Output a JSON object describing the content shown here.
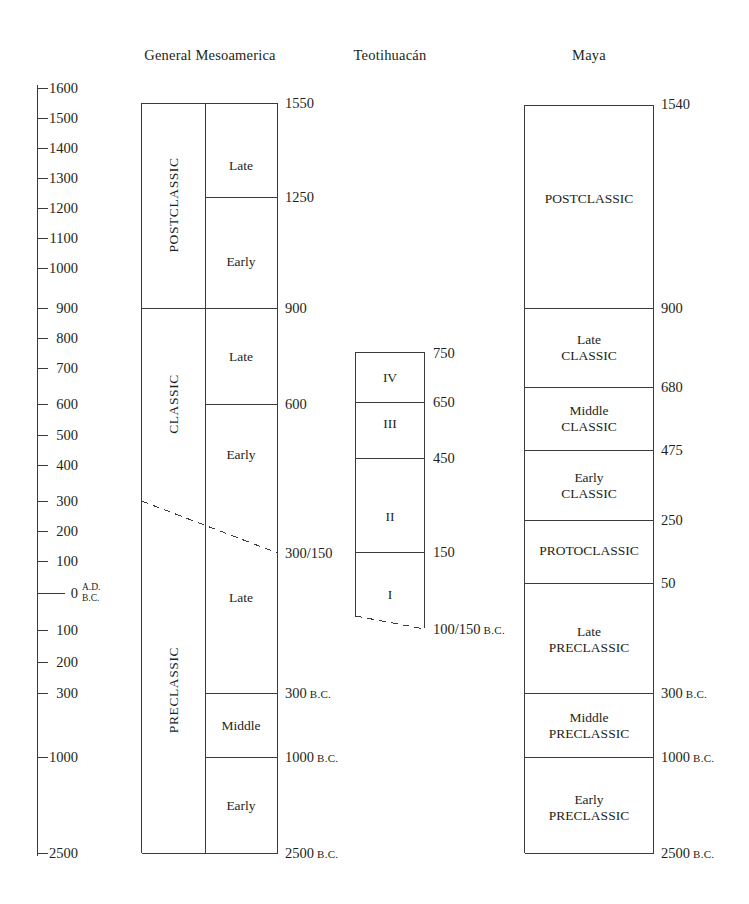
{
  "figure": {
    "type": "chronology-chart",
    "background_color": "#ffffff",
    "line_color": "#3b3b3b",
    "text_color": "#231f20"
  },
  "columns": [
    {
      "key": "general_mesoamerica",
      "header": "General Mesoamerica"
    },
    {
      "key": "teotihuacan",
      "header": "Teotihuacán"
    },
    {
      "key": "maya",
      "header": "Maya"
    }
  ],
  "axis": {
    "name": "time-axis",
    "era_upper": "A.D.",
    "era_lower": "B.C.",
    "zero_label": "0",
    "ticks": [
      {
        "label": "1600",
        "y": 88
      },
      {
        "label": "1500",
        "y": 118
      },
      {
        "label": "1400",
        "y": 148
      },
      {
        "label": "1300",
        "y": 178
      },
      {
        "label": "1200",
        "y": 208
      },
      {
        "label": "1100",
        "y": 238
      },
      {
        "label": "1000",
        "y": 268
      },
      {
        "label": "900",
        "y": 308
      },
      {
        "label": "800",
        "y": 338
      },
      {
        "label": "700",
        "y": 368
      },
      {
        "label": "600",
        "y": 404
      },
      {
        "label": "500",
        "y": 435
      },
      {
        "label": "400",
        "y": 465
      },
      {
        "label": "300",
        "y": 501
      },
      {
        "label": "200",
        "y": 531
      },
      {
        "label": "100",
        "y": 561
      },
      {
        "label": "0",
        "y": 593
      },
      {
        "label": "100",
        "y": 630
      },
      {
        "label": "200",
        "y": 662
      },
      {
        "label": "300",
        "y": 693
      },
      {
        "label": "1000",
        "y": 757
      },
      {
        "label": "2500",
        "y": 853
      }
    ]
  },
  "chart_data": {
    "type": "table",
    "ylabel": "Years (A.D. above, B.C. below)",
    "axis_tick_labels": [
      "1600",
      "1500",
      "1400",
      "1300",
      "1200",
      "1100",
      "1000",
      "900",
      "800",
      "700",
      "600",
      "500",
      "400",
      "300",
      "200",
      "100",
      "0",
      "100",
      "200",
      "300",
      "1000",
      "2500"
    ],
    "series": [
      {
        "name": "General Mesoamerica",
        "major_periods": [
          {
            "label": "POSTCLASSIC",
            "from": "A.D. 1550",
            "to": "A.D. 900"
          },
          {
            "label": "CLASSIC",
            "from": "A.D. 900",
            "to": "A.D. 300/150"
          },
          {
            "label": "PRECLASSIC",
            "from": "A.D. 300/150",
            "to": "2500 B.C."
          }
        ],
        "sub_periods": [
          {
            "label": "Late",
            "from": "A.D. 1550",
            "to": "A.D. 1250"
          },
          {
            "label": "Early",
            "from": "A.D. 1250",
            "to": "A.D. 900"
          },
          {
            "label": "Late",
            "from": "A.D. 900",
            "to": "A.D. 600"
          },
          {
            "label": "Early",
            "from": "A.D. 600",
            "to": "A.D. 300/150"
          },
          {
            "label": "Late",
            "from": "A.D. 300/150",
            "to": "300 B.C."
          },
          {
            "label": "Middle",
            "from": "300 B.C.",
            "to": "1000 B.C."
          },
          {
            "label": "Early",
            "from": "1000 B.C.",
            "to": "2500 B.C."
          }
        ],
        "boundary_labels": [
          "1550",
          "1250",
          "900",
          "600",
          "300/150",
          "300 B.C.",
          "1000 B.C.",
          "2500 B.C."
        ]
      },
      {
        "name": "Teotihuacán",
        "phases": [
          {
            "label": "IV",
            "from": "A.D. 750",
            "to": "A.D. 650"
          },
          {
            "label": "III",
            "from": "A.D. 650",
            "to": "A.D. 450"
          },
          {
            "label": "II",
            "from": "A.D. 450",
            "to": "A.D. 150"
          },
          {
            "label": "I",
            "from": "A.D. 150",
            "to": "100/150 B.C."
          }
        ],
        "boundary_labels": [
          "750",
          "650",
          "450",
          "150",
          "100/150 B.C."
        ]
      },
      {
        "name": "Maya",
        "periods": [
          {
            "label": "POSTCLASSIC",
            "from": "A.D. 1540",
            "to": "A.D. 900"
          },
          {
            "label": "Late CLASSIC",
            "from": "A.D. 900",
            "to": "A.D. 680"
          },
          {
            "label": "Middle CLASSIC",
            "from": "A.D. 680",
            "to": "A.D. 475"
          },
          {
            "label": "Early CLASSIC",
            "from": "A.D. 475",
            "to": "A.D. 250"
          },
          {
            "label": "PROTOCLASSIC",
            "from": "A.D. 250",
            "to": "A.D. 50"
          },
          {
            "label": "Late PRECLASSIC",
            "from": "A.D. 50",
            "to": "300 B.C."
          },
          {
            "label": "Middle PRECLASSIC",
            "from": "300 B.C.",
            "to": "1000 B.C."
          },
          {
            "label": "Early PRECLASSIC",
            "from": "1000 B.C.",
            "to": "2500 B.C."
          }
        ],
        "boundary_labels": [
          "1540",
          "900",
          "680",
          "475",
          "250",
          "50",
          "300 B.C.",
          "1000 B.C.",
          "2500 B.C."
        ]
      }
    ]
  },
  "general_mesoamerica": {
    "header": "General Mesoamerica",
    "major": [
      {
        "label": "POSTCLASSIC",
        "y": 205
      },
      {
        "label": "CLASSIC",
        "y": 404
      },
      {
        "label": "PRECLASSIC",
        "y": 690
      }
    ],
    "sub": [
      {
        "label": "Late",
        "y": 166
      },
      {
        "label": "Early",
        "y": 262
      },
      {
        "label": "Late",
        "y": 357
      },
      {
        "label": "Early",
        "y": 455
      },
      {
        "label": "Late",
        "y": 598
      },
      {
        "label": "Middle",
        "y": 726
      },
      {
        "label": "Early",
        "y": 806
      }
    ],
    "dates": [
      {
        "label": "1550",
        "suffix": "",
        "y": 103
      },
      {
        "label": "1250",
        "suffix": "",
        "y": 197
      },
      {
        "label": "900",
        "suffix": "",
        "y": 308
      },
      {
        "label": "600",
        "suffix": "",
        "y": 404
      },
      {
        "label": "300/150",
        "suffix": "",
        "y": 553
      },
      {
        "label": "300",
        "suffix": "B.C.",
        "y": 693
      },
      {
        "label": "1000",
        "suffix": "B.C.",
        "y": 757
      },
      {
        "label": "2500",
        "suffix": "B.C.",
        "y": 853
      }
    ]
  },
  "teotihuacan": {
    "header": "Teotihuacán",
    "phases": [
      {
        "label": "IV",
        "y": 378
      },
      {
        "label": "III",
        "y": 424
      },
      {
        "label": "II",
        "y": 517
      },
      {
        "label": "I",
        "y": 595
      }
    ],
    "dates": [
      {
        "label": "750",
        "suffix": "",
        "y": 353
      },
      {
        "label": "650",
        "suffix": "",
        "y": 402
      },
      {
        "label": "450",
        "suffix": "",
        "y": 458
      },
      {
        "label": "150",
        "suffix": "",
        "y": 552
      },
      {
        "label": "100/150",
        "suffix": "B.C.",
        "y": 629
      }
    ]
  },
  "maya": {
    "header": "Maya",
    "periods": [
      {
        "line1": "POSTCLASSIC",
        "line2": "",
        "y": 199
      },
      {
        "line1": "Late",
        "line2": "CLASSIC",
        "y": 348
      },
      {
        "line1": "Middle",
        "line2": "CLASSIC",
        "y": 419
      },
      {
        "line1": "Early",
        "line2": "CLASSIC",
        "y": 486
      },
      {
        "line1": "PROTOCLASSIC",
        "line2": "",
        "y": 551
      },
      {
        "line1": "Late",
        "line2": "PRECLASSIC",
        "y": 640
      },
      {
        "line1": "Middle",
        "line2": "PRECLASSIC",
        "y": 726
      },
      {
        "line1": "Early",
        "line2": "PRECLASSIC",
        "y": 808
      }
    ],
    "dates": [
      {
        "label": "1540",
        "suffix": "",
        "y": 104
      },
      {
        "label": "900",
        "suffix": "",
        "y": 308
      },
      {
        "label": "680",
        "suffix": "",
        "y": 387
      },
      {
        "label": "475",
        "suffix": "",
        "y": 450
      },
      {
        "label": "250",
        "suffix": "",
        "y": 520
      },
      {
        "label": "50",
        "suffix": "",
        "y": 583
      },
      {
        "label": "300",
        "suffix": "B.C.",
        "y": 693
      },
      {
        "label": "1000",
        "suffix": "B.C.",
        "y": 757
      },
      {
        "label": "2500",
        "suffix": "B.C.",
        "y": 853
      }
    ]
  }
}
